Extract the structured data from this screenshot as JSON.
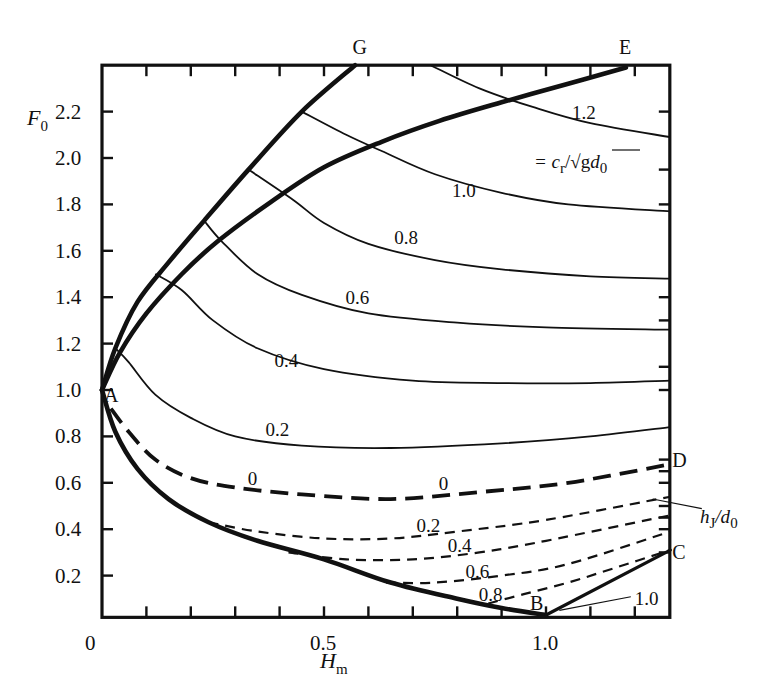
{
  "chart_data": {
    "type": "line",
    "title": "",
    "xlabel": "H_m",
    "ylabel": "F_0",
    "xlim": [
      0,
      1.28
    ],
    "ylim": [
      0.02,
      2.4
    ],
    "grid": false,
    "x_ticks": [
      {
        "value": 0,
        "label": "0"
      },
      {
        "value": 0.5,
        "label": "0.5"
      },
      {
        "value": 1.0,
        "label": "1.0"
      }
    ],
    "x_minor_ticks": [
      0.1,
      0.2,
      0.3,
      0.4,
      0.5,
      0.6,
      0.7,
      0.8,
      0.9,
      1.0,
      1.1,
      1.2
    ],
    "y_ticks": [
      {
        "value": 0.2,
        "label": "0.2"
      },
      {
        "value": 0.4,
        "label": "0.4"
      },
      {
        "value": 0.6,
        "label": "0.6"
      },
      {
        "value": 0.8,
        "label": "0.8"
      },
      {
        "value": 1.0,
        "label": "1.0"
      },
      {
        "value": 1.2,
        "label": "1.2"
      },
      {
        "value": 1.4,
        "label": "1.4"
      },
      {
        "value": 1.6,
        "label": "1.6"
      },
      {
        "value": 1.8,
        "label": "1.8"
      },
      {
        "value": 2.0,
        "label": "2.0"
      },
      {
        "value": 2.2,
        "label": "2.2"
      }
    ],
    "right_ticks": [
      0.3,
      0.4,
      0.45,
      0.5,
      0.6,
      0.65,
      0.7,
      1.0,
      1.1,
      1.3,
      1.4,
      1.8,
      1.95,
      2.2
    ],
    "legend_annotations": [
      {
        "text": "= c_r/√(g d_0)",
        "meaning": "solid curve parameter"
      },
      {
        "text": "h_J/d_0",
        "meaning": "dashed curve parameter"
      }
    ],
    "boundaries": [
      {
        "name": "A-G",
        "style": "thick",
        "points": [
          [
            0,
            1.0
          ],
          [
            0.03,
            1.18
          ],
          [
            0.08,
            1.38
          ],
          [
            0.15,
            1.55
          ],
          [
            0.23,
            1.73
          ],
          [
            0.33,
            1.95
          ],
          [
            0.45,
            2.2
          ],
          [
            0.57,
            2.4
          ]
        ]
      },
      {
        "name": "A-E",
        "style": "thick",
        "points": [
          [
            0,
            1.0
          ],
          [
            0.04,
            1.16
          ],
          [
            0.1,
            1.33
          ],
          [
            0.18,
            1.5
          ],
          [
            0.26,
            1.64
          ],
          [
            0.38,
            1.81
          ],
          [
            0.5,
            1.96
          ],
          [
            0.63,
            2.07
          ],
          [
            0.76,
            2.16
          ],
          [
            0.9,
            2.24
          ],
          [
            1.05,
            2.32
          ],
          [
            1.18,
            2.39
          ]
        ]
      },
      {
        "name": "A-B",
        "style": "thick",
        "points": [
          [
            0,
            1.0
          ],
          [
            0.03,
            0.82
          ],
          [
            0.08,
            0.66
          ],
          [
            0.15,
            0.53
          ],
          [
            0.24,
            0.43
          ],
          [
            0.35,
            0.35
          ],
          [
            0.5,
            0.27
          ],
          [
            0.65,
            0.17
          ],
          [
            0.8,
            0.1
          ],
          [
            0.9,
            0.06
          ],
          [
            1.0,
            0.03
          ]
        ]
      },
      {
        "name": "B-C",
        "style": "medium",
        "points": [
          [
            1.0,
            0.03
          ],
          [
            1.28,
            0.31
          ]
        ]
      }
    ],
    "series": [
      {
        "name": "1.2",
        "style": "solid",
        "points": [
          [
            0.74,
            2.4
          ],
          [
            0.85,
            2.3
          ],
          [
            0.97,
            2.22
          ],
          [
            1.1,
            2.15
          ],
          [
            1.28,
            2.09
          ]
        ],
        "label_pos": [
          1.09,
          2.2
        ]
      },
      {
        "name": "1.0",
        "style": "solid",
        "points": [
          [
            0.45,
            2.2
          ],
          [
            0.55,
            2.1
          ],
          [
            0.63,
            2.03
          ],
          [
            0.75,
            1.93
          ],
          [
            0.9,
            1.85
          ],
          [
            1.05,
            1.8
          ],
          [
            1.28,
            1.77
          ]
        ],
        "label_pos": [
          0.82,
          1.86
        ]
      },
      {
        "name": "0.8",
        "style": "solid",
        "points": [
          [
            0.33,
            1.95
          ],
          [
            0.43,
            1.82
          ],
          [
            0.5,
            1.72
          ],
          [
            0.6,
            1.63
          ],
          [
            0.75,
            1.56
          ],
          [
            0.9,
            1.52
          ],
          [
            1.1,
            1.49
          ],
          [
            1.28,
            1.48
          ]
        ],
        "label_pos": [
          0.69,
          1.66
        ]
      },
      {
        "name": "0.6",
        "style": "solid",
        "points": [
          [
            0.23,
            1.73
          ],
          [
            0.27,
            1.64
          ],
          [
            0.35,
            1.5
          ],
          [
            0.45,
            1.41
          ],
          [
            0.6,
            1.33
          ],
          [
            0.8,
            1.29
          ],
          [
            1.0,
            1.27
          ],
          [
            1.28,
            1.26
          ]
        ],
        "label_pos": [
          0.58,
          1.4
        ]
      },
      {
        "name": "0.4",
        "style": "solid",
        "points": [
          [
            0.12,
            1.5
          ],
          [
            0.18,
            1.43
          ],
          [
            0.25,
            1.3
          ],
          [
            0.35,
            1.18
          ],
          [
            0.5,
            1.09
          ],
          [
            0.7,
            1.04
          ],
          [
            0.9,
            1.03
          ],
          [
            1.1,
            1.03
          ],
          [
            1.28,
            1.04
          ]
        ],
        "label_pos": [
          0.42,
          1.13
        ]
      },
      {
        "name": "0.2",
        "style": "solid",
        "points": [
          [
            0.03,
            1.18
          ],
          [
            0.06,
            1.12
          ],
          [
            0.12,
            0.98
          ],
          [
            0.2,
            0.88
          ],
          [
            0.3,
            0.8
          ],
          [
            0.45,
            0.76
          ],
          [
            0.65,
            0.75
          ],
          [
            0.9,
            0.77
          ],
          [
            1.1,
            0.8
          ],
          [
            1.28,
            0.84
          ]
        ],
        "label_pos": [
          0.4,
          0.83
        ]
      },
      {
        "name": "0",
        "style": "dash-thick",
        "points": [
          [
            0.02,
            0.92
          ],
          [
            0.06,
            0.82
          ],
          [
            0.12,
            0.7
          ],
          [
            0.2,
            0.62
          ],
          [
            0.3,
            0.58
          ],
          [
            0.45,
            0.55
          ],
          [
            0.65,
            0.53
          ],
          [
            0.85,
            0.56
          ],
          [
            1.05,
            0.6
          ],
          [
            1.28,
            0.68
          ]
        ],
        "label_pos": [
          [
            0.36,
            0.62
          ],
          [
            0.79,
            0.6
          ]
        ]
      },
      {
        "name": "0.2",
        "style": "dash",
        "points": [
          [
            0.24,
            0.43
          ],
          [
            0.35,
            0.39
          ],
          [
            0.5,
            0.36
          ],
          [
            0.65,
            0.36
          ],
          [
            0.8,
            0.39
          ],
          [
            1.0,
            0.44
          ],
          [
            1.28,
            0.54
          ]
        ],
        "label_pos": [
          0.74,
          0.42
        ]
      },
      {
        "name": "0.4",
        "style": "dash",
        "points": [
          [
            0.42,
            0.3
          ],
          [
            0.55,
            0.27
          ],
          [
            0.7,
            0.27
          ],
          [
            0.85,
            0.3
          ],
          [
            1.0,
            0.35
          ],
          [
            1.28,
            0.46
          ]
        ],
        "label_pos": [
          0.81,
          0.33
        ]
      },
      {
        "name": "0.6",
        "style": "dash",
        "points": [
          [
            0.64,
            0.17
          ],
          [
            0.75,
            0.17
          ],
          [
            0.9,
            0.2
          ],
          [
            1.05,
            0.25
          ],
          [
            1.28,
            0.39
          ]
        ],
        "label_pos": [
          0.85,
          0.22
        ]
      },
      {
        "name": "0.8",
        "style": "dash",
        "points": [
          [
            0.87,
            0.08
          ],
          [
            0.95,
            0.12
          ],
          [
            1.05,
            0.17
          ],
          [
            1.15,
            0.23
          ],
          [
            1.28,
            0.31
          ]
        ],
        "label_pos": [
          0.88,
          0.12
        ]
      }
    ],
    "point_labels": [
      {
        "text": "A",
        "at": [
          0.02,
          0.98
        ]
      },
      {
        "text": "B",
        "at": [
          0.98,
          0.08
        ]
      },
      {
        "text": "C",
        "at": [
          1.3,
          0.3
        ]
      },
      {
        "text": "D",
        "at": [
          1.3,
          0.7
        ]
      },
      {
        "text": "E",
        "at": [
          1.18,
          2.48
        ]
      },
      {
        "text": "G",
        "at": [
          0.58,
          2.48
        ]
      }
    ],
    "extra_labels": [
      {
        "text": "1.0",
        "at": [
          1.2,
          0.1
        ],
        "leader_to": [
          1.03,
          0.05
        ]
      },
      {
        "text": "h_J/d_0",
        "at": [
          1.36,
          0.48
        ],
        "leader_to": [
          1.24,
          0.53
        ]
      }
    ]
  },
  "labels": {
    "y_axis_title": "F",
    "y_axis_sub": "0",
    "x_axis_title": "H",
    "x_axis_sub": "m",
    "cr_eq": "= c",
    "cr_sub": "r",
    "cr_rest": "/√g",
    "cr_d": "d",
    "cr_d_sub": "0",
    "hj_h": "h",
    "hj_sub": "J",
    "hj_d": "/d",
    "hj_d_sub": "0"
  }
}
